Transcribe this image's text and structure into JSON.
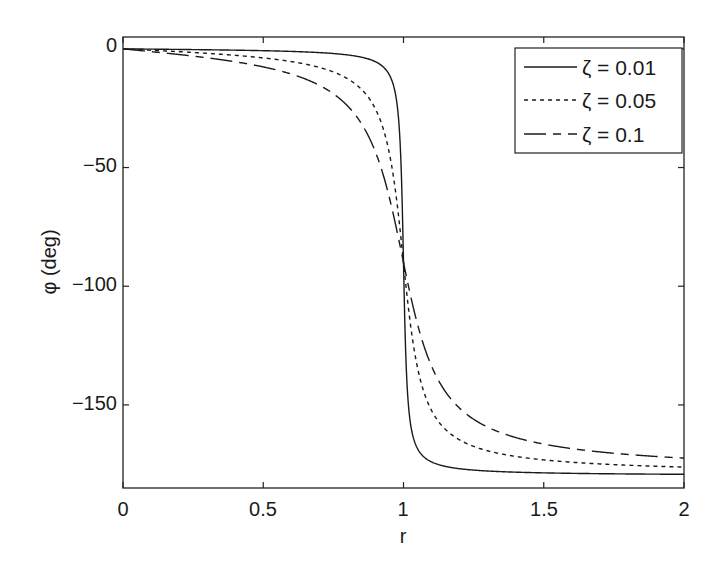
{
  "chart_data": {
    "type": "line",
    "title": "",
    "xlabel": "r",
    "ylabel": "φ (deg)",
    "xlim": [
      0,
      2
    ],
    "ylim": [
      -185,
      5
    ],
    "grid": false,
    "legend_position": "upper right",
    "xticks": [
      0,
      0.5,
      1,
      1.5,
      2
    ],
    "xtick_labels": [
      "0",
      "0.5",
      "1",
      "1.5",
      "2"
    ],
    "yticks": [
      0,
      -50,
      -100,
      -150
    ],
    "ytick_labels": [
      "0",
      "−50",
      "−100",
      "−150"
    ],
    "x": [
      0,
      0.1,
      0.2,
      0.3,
      0.4,
      0.5,
      0.6,
      0.7,
      0.8,
      0.85,
      0.9,
      0.95,
      0.98,
      1.0,
      1.02,
      1.05,
      1.1,
      1.15,
      1.2,
      1.3,
      1.4,
      1.5,
      1.6,
      1.7,
      1.8,
      1.9,
      2.0
    ],
    "series": [
      {
        "name": "ζ = 0.01",
        "style": "solid",
        "zeta": 0.01,
        "values": [
          0,
          -0.1,
          -0.2,
          -0.4,
          -0.5,
          -0.8,
          -1.1,
          -1.6,
          -2.5,
          -3.5,
          -5.4,
          -11.0,
          -26.6,
          -90,
          -153.0,
          -168.8,
          -174.5,
          -176.2,
          -177.2,
          -178.0,
          -178.6,
          -178.9,
          -179.1,
          -179.2,
          -179.3,
          -179.4,
          -179.4
        ]
      },
      {
        "name": "ζ = 0.05",
        "style": "dashed",
        "zeta": 0.05,
        "values": [
          0,
          -0.6,
          -1.2,
          -1.9,
          -2.7,
          -3.8,
          -5.4,
          -7.8,
          -12.5,
          -17.0,
          -25.3,
          -44.3,
          -68.2,
          -90,
          -111.4,
          -134.3,
          -152.4,
          -160.2,
          -164.1,
          -168.2,
          -170.3,
          -171.5,
          -172.3,
          -172.9,
          -173.4,
          -173.8,
          -174.3
        ]
      },
      {
        "name": "ζ = 0.1",
        "style": "dash-dot",
        "zeta": 0.1,
        "values": [
          0,
          -1.2,
          -2.4,
          -3.8,
          -5.4,
          -7.6,
          -10.6,
          -15.4,
          -24.0,
          -31.5,
          -43.5,
          -62.9,
          -78.8,
          -90,
          -101.2,
          -116.0,
          -133.6,
          -144.5,
          -151.2,
          -158.3,
          -162.2,
          -164.5,
          -166.2,
          -167.2,
          -168.3,
          -169.0,
          -172.4
        ]
      }
    ]
  },
  "legend": {
    "items": [
      {
        "label": "ζ = 0.01",
        "style": "solid"
      },
      {
        "label": "ζ = 0.05",
        "style": "dashed"
      },
      {
        "label": "ζ = 0.1",
        "style": "dash-dot"
      }
    ]
  },
  "colors": {
    "line": "#1a1a1a",
    "axes": "#222222",
    "background": "#ffffff"
  }
}
